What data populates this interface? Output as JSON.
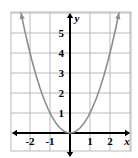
{
  "figure": {
    "title": "",
    "background_color": "#ffffff",
    "frame": {
      "left": 11,
      "top": 12,
      "right": 131,
      "bottom": 151
    }
  },
  "chart_data": {
    "type": "line",
    "title": "",
    "xlabel": "x",
    "ylabel": "y",
    "function": "y = x^2",
    "xlim": [
      -2.95,
      3.05
    ],
    "ylim": [
      -0.9,
      6.05
    ],
    "grid": true,
    "grid_spacing": 1,
    "grid_color": "#b9b9bd",
    "axis_color": "#000000",
    "curve_color": "#8d8d8d",
    "legend": "none",
    "x_ticks": [
      -2,
      -1,
      1,
      2
    ],
    "x_tick_labels": [
      "-2",
      "-1",
      "1",
      "2"
    ],
    "y_ticks": [
      1,
      2,
      3,
      4,
      5
    ],
    "y_tick_labels": [
      "1",
      "2",
      "3",
      "4",
      "5"
    ],
    "series": [
      {
        "name": "y = x^2",
        "color": "#8d8d8d",
        "arrow_start": true,
        "arrow_end": true,
        "points": [
          {
            "x": -2.45,
            "y": 6.0025
          },
          {
            "x": -2.3,
            "y": 5.29
          },
          {
            "x": -2.1,
            "y": 4.41
          },
          {
            "x": -1.9,
            "y": 3.61
          },
          {
            "x": -1.7,
            "y": 2.89
          },
          {
            "x": -1.5,
            "y": 2.25
          },
          {
            "x": -1.3,
            "y": 1.69
          },
          {
            "x": -1.1,
            "y": 1.21
          },
          {
            "x": -0.9,
            "y": 0.81
          },
          {
            "x": -0.7,
            "y": 0.49
          },
          {
            "x": -0.5,
            "y": 0.25
          },
          {
            "x": -0.3,
            "y": 0.09
          },
          {
            "x": -0.15,
            "y": 0.0225
          },
          {
            "x": 0,
            "y": 0
          },
          {
            "x": 0.15,
            "y": 0.0225
          },
          {
            "x": 0.3,
            "y": 0.09
          },
          {
            "x": 0.5,
            "y": 0.25
          },
          {
            "x": 0.7,
            "y": 0.49
          },
          {
            "x": 0.9,
            "y": 0.81
          },
          {
            "x": 1.1,
            "y": 1.21
          },
          {
            "x": 1.3,
            "y": 1.69
          },
          {
            "x": 1.5,
            "y": 2.25
          },
          {
            "x": 1.7,
            "y": 2.89
          },
          {
            "x": 1.9,
            "y": 3.61
          },
          {
            "x": 2.1,
            "y": 4.41
          },
          {
            "x": 2.3,
            "y": 5.29
          },
          {
            "x": 2.45,
            "y": 6.0025
          }
        ]
      }
    ]
  }
}
